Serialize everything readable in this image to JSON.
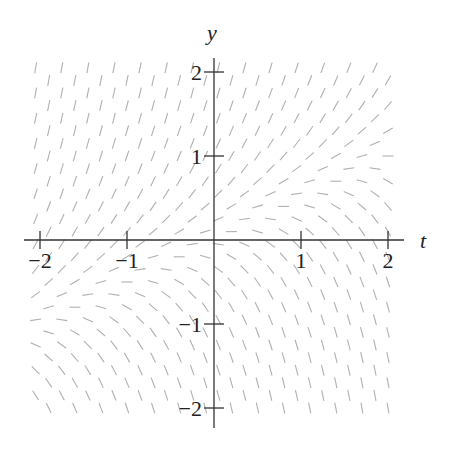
{
  "chart_data": {
    "type": "slope_field",
    "title": "",
    "xlabel": "t",
    "ylabel": "y",
    "equation_estimate": "dy/dt = 2y - t",
    "xlim": [
      -2.1,
      2.1
    ],
    "ylim": [
      -2.1,
      2.1
    ],
    "x_ticks": [
      -2,
      -1,
      1,
      2
    ],
    "x_tick_labels": [
      "−2",
      "−1",
      "1",
      "2"
    ],
    "y_ticks": [
      -2,
      -1,
      1,
      2
    ],
    "y_tick_labels": [
      "−2",
      "−1",
      "1",
      "2"
    ],
    "grid_step": 0.15,
    "staggered_rows": true,
    "segment_color": "#b0b0b0",
    "axis_color": "#333333",
    "grid": false,
    "legend": null
  },
  "layout": {
    "origin_px": [
      214,
      240
    ],
    "unit_px_x": 87,
    "unit_px_y": 84,
    "segment_len_px": 11
  }
}
